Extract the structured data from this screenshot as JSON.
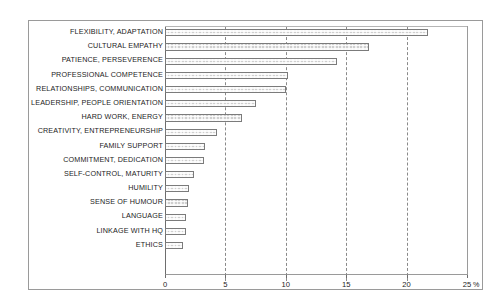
{
  "chart_data": {
    "type": "bar",
    "orientation": "horizontal",
    "title": "",
    "xlabel": "%",
    "ylabel": "",
    "xlim": [
      0,
      25
    ],
    "xticks": [
      0,
      5,
      10,
      15,
      20,
      25
    ],
    "xtick_labels": [
      "0",
      "5",
      "10",
      "15",
      "20",
      "25"
    ],
    "unit": "%",
    "grid": "vertical-dashed",
    "legend": "none",
    "bar_fill": "#cfcfcf",
    "bar_edge": "#7b7b7b",
    "categories": [
      "FLEXIBILITY, ADAPTATION",
      "CULTURAL EMPATHY",
      "PATIENCE, PERSEVERENCE",
      "PROFESSIONAL COMPETENCE",
      "RELATIONSHIPS, COMMUNICATION",
      "LEADERSHIP, PEOPLE ORIENTATION",
      "HARD WORK, ENERGY",
      "CREATIVITY, ENTREPRENEURSHIP",
      "FAMILY SUPPORT",
      "COMMITMENT, DEDICATION",
      "SELF-CONTROL, MATURITY",
      "HUMILITY",
      "SENSE OF HUMOUR",
      "LANGUAGE",
      "LINKAGE WITH HQ",
      "ETHICS"
    ],
    "values": [
      21.8,
      16.9,
      14.2,
      10.2,
      10.0,
      7.5,
      6.4,
      4.3,
      3.3,
      3.2,
      2.4,
      2.0,
      1.9,
      1.7,
      1.7,
      1.5
    ]
  }
}
